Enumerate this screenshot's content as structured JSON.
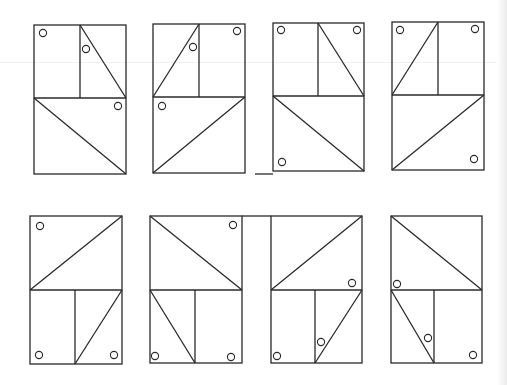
{
  "colors": {
    "stroke": "#2a2a2a",
    "background": "#ffffff"
  },
  "figures": [
    {
      "id": 1,
      "row": 1,
      "col": 1,
      "rect": [
        34,
        25,
        126,
        174
      ],
      "mid_y": 98,
      "split_x": 80,
      "diagonals": [
        [
          80,
          25,
          126,
          98
        ],
        [
          34,
          98,
          126,
          174
        ]
      ],
      "circles": [
        [
          43,
          33
        ],
        [
          86,
          49
        ],
        [
          118,
          106
        ]
      ]
    },
    {
      "id": 2,
      "row": 1,
      "col": 2,
      "rect": [
        153,
        24,
        245,
        173
      ],
      "mid_y": 97,
      "split_x": 199,
      "diagonals": [
        [
          199,
          24,
          153,
          97
        ],
        [
          245,
          97,
          153,
          173
        ]
      ],
      "circles": [
        [
          237,
          31
        ],
        [
          193,
          47
        ],
        [
          162,
          106
        ]
      ]
    },
    {
      "id": 3,
      "row": 1,
      "col": 3,
      "rect": [
        273,
        23,
        364,
        171
      ],
      "mid_y": 96,
      "split_x": 318,
      "diagonals": [
        [
          318,
          23,
          364,
          96
        ],
        [
          273,
          96,
          364,
          171
        ]
      ],
      "circles": [
        [
          281,
          30
        ],
        [
          357,
          30
        ],
        [
          282,
          162
        ]
      ]
    },
    {
      "id": 4,
      "row": 1,
      "col": 4,
      "rect": [
        392,
        22,
        484,
        170
      ],
      "mid_y": 95,
      "split_x": 438,
      "diagonals": [
        [
          438,
          22,
          392,
          95
        ],
        [
          484,
          95,
          392,
          170
        ]
      ],
      "circles": [
        [
          400,
          30
        ],
        [
          475,
          29
        ],
        [
          474,
          159
        ]
      ]
    },
    {
      "id": 5,
      "row": 2,
      "col": 1,
      "rect": [
        30,
        216,
        122,
        364
      ],
      "mid_y": 290,
      "split_x": 75,
      "diagonals": [
        [
          122,
          216,
          30,
          290
        ],
        [
          122,
          290,
          75,
          364
        ]
      ],
      "circles": [
        [
          40,
          226
        ],
        [
          39,
          355
        ],
        [
          114,
          355
        ]
      ]
    },
    {
      "id": 6,
      "row": 2,
      "col": 2,
      "rect": [
        150,
        216,
        242,
        363
      ],
      "mid_y": 290,
      "split_x": 195,
      "diagonals": [
        [
          150,
          216,
          242,
          290
        ],
        [
          150,
          290,
          195,
          363
        ]
      ],
      "circles": [
        [
          233,
          225
        ],
        [
          155,
          356
        ],
        [
          231,
          357
        ]
      ]
    },
    {
      "id": 7,
      "row": 2,
      "col": 3,
      "rect": [
        271,
        216,
        362,
        363
      ],
      "mid_y": 290,
      "split_x": 315,
      "diagonals": [
        [
          362,
          216,
          271,
          290
        ],
        [
          362,
          290,
          315,
          363
        ]
      ],
      "circles": [
        [
          352,
          283
        ],
        [
          321,
          342
        ],
        [
          277,
          356
        ]
      ]
    },
    {
      "id": 8,
      "row": 2,
      "col": 4,
      "rect": [
        391,
        216,
        482,
        363
      ],
      "mid_y": 290,
      "split_x": 434,
      "diagonals": [
        [
          391,
          216,
          482,
          290
        ],
        [
          391,
          290,
          434,
          363
        ]
      ],
      "circles": [
        [
          397,
          284
        ],
        [
          428,
          338
        ],
        [
          473,
          355
        ]
      ]
    }
  ],
  "extra_lines": [
    [
      242,
      216,
      271,
      216
    ],
    [
      255,
      174,
      273,
      174
    ]
  ]
}
